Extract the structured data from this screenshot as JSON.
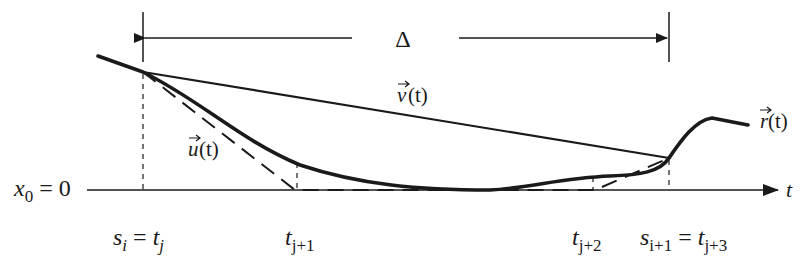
{
  "diagram": {
    "interval_label": "Δ",
    "curves": {
      "r": {
        "name": "r",
        "arg": "(t)",
        "style": "thick-solid"
      },
      "v": {
        "name": "v",
        "arg": "(t)",
        "style": "thin-solid-chord"
      },
      "u": {
        "name": "u",
        "arg": "(t)",
        "style": "dashed-piecewise-linear"
      }
    },
    "axis": {
      "origin_label_var": "x",
      "origin_label_sub": "0",
      "origin_label_rest": " = 0",
      "variable": "t"
    },
    "ticks": [
      {
        "id": "si",
        "main": "s",
        "sub": "i",
        "eq": " = ",
        "main2": "t",
        "sub2": "j"
      },
      {
        "id": "tj1",
        "main": "t",
        "sub": "j+1"
      },
      {
        "id": "tj2",
        "main": "t",
        "sub": "j+2"
      },
      {
        "id": "si1",
        "main": "s",
        "sub": "i+1",
        "eq": " = ",
        "main2": "t",
        "sub2": "j+3"
      }
    ],
    "colors": {
      "ink": "#1a1a1a",
      "background": "#ffffff"
    }
  }
}
